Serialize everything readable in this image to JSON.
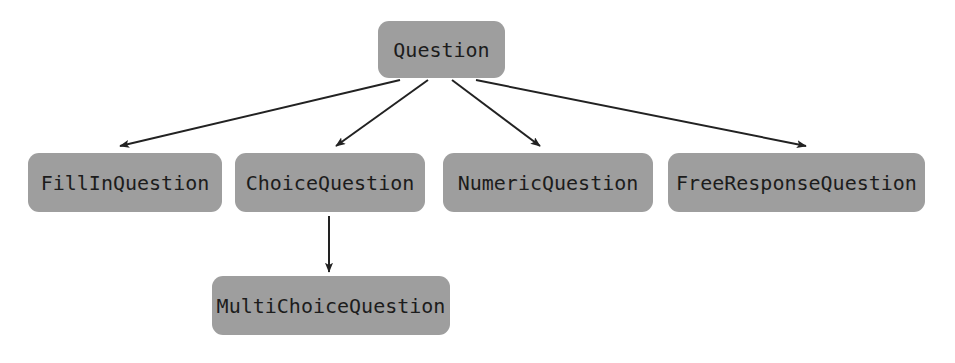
{
  "diagram": {
    "type": "class-inheritance-hierarchy",
    "background_color": "#ffffff",
    "node_fill_color": "#9e9e9e",
    "node_text_color": "#1c1c1c",
    "edge_color": "#222222",
    "nodes": [
      {
        "id": "question",
        "label": "Question",
        "level": 1
      },
      {
        "id": "fillin",
        "label": "FillInQuestion",
        "level": 2
      },
      {
        "id": "choice",
        "label": "ChoiceQuestion",
        "level": 2
      },
      {
        "id": "numeric",
        "label": "NumericQuestion",
        "level": 2
      },
      {
        "id": "freeresponse",
        "label": "FreeResponseQuestion",
        "level": 2
      },
      {
        "id": "multichoice",
        "label": "MultiChoiceQuestion",
        "level": 3
      }
    ],
    "edges": [
      {
        "from": "question",
        "to": "fillin"
      },
      {
        "from": "question",
        "to": "choice"
      },
      {
        "from": "question",
        "to": "numeric"
      },
      {
        "from": "question",
        "to": "freeresponse"
      },
      {
        "from": "choice",
        "to": "multichoice"
      }
    ]
  }
}
